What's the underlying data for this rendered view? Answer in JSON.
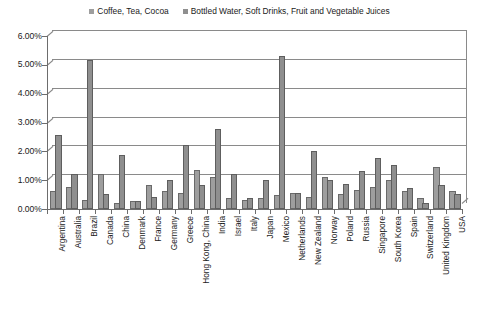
{
  "chart_data": {
    "type": "bar",
    "title": "",
    "subtitle": "",
    "xlabel": "",
    "ylabel": "",
    "ylim": [
      0,
      6
    ],
    "ytick_labels": [
      "0.00%",
      "1.00%",
      "2.00%",
      "3.00%",
      "4.00%",
      "5.00%",
      "6.00%"
    ],
    "ytick_values": [
      0,
      1,
      2,
      3,
      4,
      5,
      6
    ],
    "grid": "horizontal",
    "legend_position": "top-center",
    "value_unit": "percent",
    "categories": [
      "Argentina",
      "Australia",
      "Brazil",
      "Canada",
      "China",
      "Denmark",
      "France",
      "Germany",
      "Greece",
      "Hong Kong, China",
      "India",
      "Israel",
      "Italy",
      "Japan",
      "Mexico",
      "Netherlands",
      "New Zealand",
      "Norway",
      "Poland",
      "Russia",
      "Singapore",
      "South Korea",
      "Spain",
      "Switzerland",
      "United Kingdom",
      "USA"
    ],
    "series": [
      {
        "name": "Coffee, Tea, Cocoa",
        "color": "#9e9e9e",
        "values": [
          0.55,
          0.7,
          0.25,
          1.15,
          0.15,
          0.2,
          0.75,
          0.55,
          0.5,
          1.3,
          1.05,
          0.3,
          0.25,
          0.3,
          0.4,
          0.5,
          0.35,
          1.05,
          0.45,
          0.6,
          0.7,
          0.95,
          0.55,
          0.3,
          1.4,
          0.55
        ]
      },
      {
        "name": "Bottled Water, Soft Drinks, Fruit and Vegetable Juices",
        "color": "#8f8f8f",
        "values": [
          2.5,
          1.15,
          5.1,
          0.45,
          1.8,
          0.2,
          0.35,
          0.95,
          2.15,
          0.75,
          2.7,
          1.15,
          0.3,
          0.95,
          5.25,
          0.5,
          1.95,
          0.95,
          0.8,
          1.25,
          1.7,
          1.45,
          0.65,
          0.15,
          0.75,
          0.45
        ]
      }
    ]
  },
  "legend": {
    "entries": [
      {
        "label": "Coffee, Tea, Cocoa",
        "color": "#9e9e9e"
      },
      {
        "label": "Bottled Water, Soft Drinks, Fruit and Vegetable Juices",
        "color": "#8f8f8f"
      }
    ]
  }
}
